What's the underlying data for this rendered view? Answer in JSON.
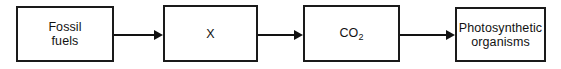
{
  "diagram": {
    "type": "flow-chart",
    "orientation": "horizontal",
    "background_color": "#ffffff",
    "line_color": "#121212",
    "nodes": [
      {
        "id": "fossil-fuels",
        "label": "Fossil\nfuels"
      },
      {
        "id": "x",
        "label": "X"
      },
      {
        "id": "co2",
        "label_main": "CO",
        "label_sub": "2"
      },
      {
        "id": "photosynthetic-organisms",
        "label": "Photosynthetic\norganisms"
      }
    ],
    "arrows": [
      {
        "id": "arrow-1",
        "from": "fossil-fuels",
        "to": "x",
        "direction": "right"
      },
      {
        "id": "arrow-2",
        "from": "x",
        "to": "co2",
        "direction": "right"
      },
      {
        "id": "arrow-3",
        "from": "co2",
        "to": "photosynthetic-organisms",
        "direction": "right"
      }
    ]
  }
}
